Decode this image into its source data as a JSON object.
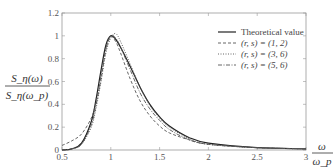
{
  "chart_data": {
    "type": "line",
    "title": "",
    "xlabel": "ω/ω_p",
    "ylabel": "S_η(ω)/S_η(ω_p)",
    "xlim": [
      0.5,
      3
    ],
    "ylim": [
      0,
      1.2
    ],
    "x_ticks": [
      "0.5",
      "1",
      "1.5",
      "2",
      "2.5",
      "3"
    ],
    "y_ticks": [
      "0",
      "0.2",
      "0.4",
      "0.6",
      "0.8",
      "1",
      "1.2"
    ],
    "grid": false,
    "legend_position": "upper right",
    "x": [
      0.5,
      0.6,
      0.7,
      0.8,
      0.85,
      0.9,
      0.95,
      1.0,
      1.05,
      1.1,
      1.2,
      1.3,
      1.4,
      1.5,
      1.6,
      1.8,
      2.0,
      2.5,
      3.0
    ],
    "series": [
      {
        "name": "Theoretical value",
        "style": "solid",
        "values": [
          0.0,
          0.01,
          0.06,
          0.25,
          0.45,
          0.7,
          0.92,
          1.0,
          0.97,
          0.9,
          0.73,
          0.55,
          0.4,
          0.29,
          0.21,
          0.11,
          0.06,
          0.02,
          0.01
        ]
      },
      {
        "name": "(r, s) = (1, 2)",
        "style": "dashed",
        "values": [
          0.04,
          0.08,
          0.14,
          0.28,
          0.42,
          0.62,
          0.88,
          0.99,
          0.95,
          0.85,
          0.62,
          0.43,
          0.3,
          0.21,
          0.15,
          0.09,
          0.05,
          0.02,
          0.01
        ]
      },
      {
        "name": "(r, s) = (3, 6)",
        "style": "dotted",
        "values": [
          0.0,
          0.01,
          0.05,
          0.2,
          0.37,
          0.6,
          0.85,
          0.98,
          1.02,
          0.95,
          0.75,
          0.55,
          0.39,
          0.28,
          0.2,
          0.1,
          0.05,
          0.02,
          0.01
        ]
      },
      {
        "name": "(r, s) = (5, 6)",
        "style": "dashdot",
        "values": [
          0.0,
          0.01,
          0.05,
          0.22,
          0.4,
          0.65,
          0.89,
          1.0,
          0.98,
          0.9,
          0.7,
          0.5,
          0.36,
          0.26,
          0.18,
          0.09,
          0.05,
          0.02,
          0.01
        ]
      }
    ]
  },
  "legend": {
    "items": [
      {
        "label": "Theoretical value"
      },
      {
        "label": "(r, s) = (1, 2)"
      },
      {
        "label": "(r, s) = (3, 6)"
      },
      {
        "label": "(r, s) = (5, 6)"
      }
    ]
  },
  "axes": {
    "ylabel_num": "S_η(ω)",
    "ylabel_den": "S_η(ω_p)",
    "xlabel_num": "ω",
    "xlabel_den": "ω_p"
  }
}
